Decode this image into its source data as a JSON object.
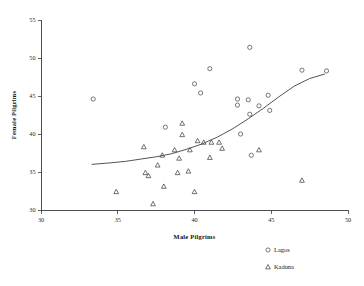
{
  "chart_data": {
    "type": "scatter",
    "title": "",
    "xlabel": "Male Pilgrims",
    "ylabel": "Female Pilgrims",
    "xlim": [
      30,
      50
    ],
    "ylim": [
      30,
      55
    ],
    "xticks": [
      30,
      35,
      40,
      45,
      50
    ],
    "yticks": [
      30,
      35,
      40,
      45,
      50,
      55
    ],
    "grid": false,
    "legend_position": "bottom-right",
    "legend": [
      {
        "label": "Lagos",
        "marker": "circle"
      },
      {
        "label": "Kaduna",
        "marker": "triangle"
      }
    ],
    "series": [
      {
        "name": "Lagos",
        "marker": "circle",
        "points": [
          [
            33.4,
            44.6
          ],
          [
            38.1,
            40.9
          ],
          [
            40.0,
            46.6
          ],
          [
            40.4,
            45.4
          ],
          [
            41.0,
            48.6
          ],
          [
            42.8,
            44.6
          ],
          [
            42.8,
            43.8
          ],
          [
            43.0,
            40.0
          ],
          [
            43.5,
            44.5
          ],
          [
            43.6,
            51.4
          ],
          [
            43.6,
            42.6
          ],
          [
            43.7,
            37.2
          ],
          [
            44.2,
            43.7
          ],
          [
            44.8,
            45.1
          ],
          [
            44.9,
            43.1
          ],
          [
            47.0,
            48.4
          ],
          [
            48.6,
            48.3
          ]
        ]
      },
      {
        "name": "Kaduna",
        "marker": "triangle",
        "points": [
          [
            34.9,
            32.4
          ],
          [
            36.7,
            38.3
          ],
          [
            36.8,
            34.9
          ],
          [
            37.0,
            34.5
          ],
          [
            37.3,
            30.8
          ],
          [
            37.6,
            35.9
          ],
          [
            37.9,
            37.2
          ],
          [
            38.0,
            33.1
          ],
          [
            38.7,
            37.9
          ],
          [
            38.9,
            34.9
          ],
          [
            39.0,
            36.8
          ],
          [
            39.2,
            41.4
          ],
          [
            39.2,
            39.9
          ],
          [
            39.6,
            35.1
          ],
          [
            39.7,
            37.9
          ],
          [
            40.0,
            32.4
          ],
          [
            40.2,
            39.1
          ],
          [
            40.6,
            38.9
          ],
          [
            41.0,
            36.9
          ],
          [
            41.1,
            38.9
          ],
          [
            41.6,
            38.9
          ],
          [
            41.8,
            38.1
          ],
          [
            44.2,
            37.9
          ],
          [
            47.0,
            33.9
          ]
        ]
      }
    ],
    "fit_curve": {
      "name": "trend",
      "points": [
        [
          33.3,
          36.0
        ],
        [
          34.5,
          36.2
        ],
        [
          35.5,
          36.4
        ],
        [
          36.5,
          36.7
        ],
        [
          37.5,
          37.0
        ],
        [
          38.5,
          37.4
        ],
        [
          39.5,
          38.0
        ],
        [
          40.5,
          38.7
        ],
        [
          41.5,
          39.6
        ],
        [
          42.5,
          40.7
        ],
        [
          43.5,
          42.0
        ],
        [
          44.5,
          43.4
        ],
        [
          45.5,
          44.9
        ],
        [
          46.5,
          46.3
        ],
        [
          47.5,
          47.3
        ],
        [
          48.5,
          47.9
        ]
      ]
    }
  }
}
